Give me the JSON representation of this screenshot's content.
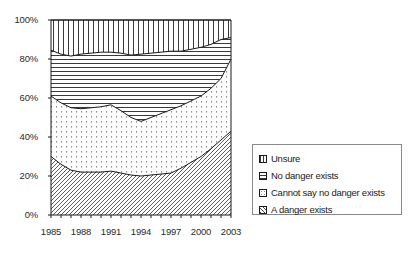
{
  "chart_data": {
    "type": "area",
    "stacked": true,
    "stack_mode": "percent",
    "title": "",
    "xlabel": "",
    "ylabel": "",
    "ylim": [
      0,
      100
    ],
    "ytick_labels": [
      "0%",
      "20%",
      "40%",
      "60%",
      "80%",
      "100%"
    ],
    "ytick_values": [
      0,
      20,
      40,
      60,
      80,
      100
    ],
    "grid": false,
    "legend_position": "right",
    "x": [
      1985,
      1986,
      1987,
      1988,
      1989,
      1990,
      1991,
      1992,
      1993,
      1994,
      1995,
      1996,
      1997,
      1998,
      1999,
      2000,
      2001,
      2002,
      2003
    ],
    "xtick_labels": [
      "1985",
      "1988",
      "1991",
      "1994",
      "1997",
      "2000",
      "2003"
    ],
    "xtick_values": [
      1985,
      1988,
      1991,
      1994,
      1997,
      2000,
      2003
    ],
    "series": [
      {
        "name": "A danger exists",
        "pattern": "diagonal-hatch",
        "order": 1,
        "values": [
          30,
          26,
          23,
          22,
          22,
          22,
          22.5,
          21.5,
          20.5,
          20,
          20.5,
          21,
          21.5,
          24,
          27,
          30,
          34,
          38.5,
          43
        ]
      },
      {
        "name": "Cannot say no danger exists",
        "pattern": "dotted",
        "order": 2,
        "values": [
          31,
          31.5,
          32,
          32.5,
          33,
          33.5,
          34,
          32,
          29.5,
          28,
          29.5,
          31,
          32.5,
          32,
          31.5,
          31,
          31,
          31.5,
          37
        ]
      },
      {
        "name": "No danger exists",
        "pattern": "horizontal-lines",
        "order": 3,
        "values": [
          23.5,
          25,
          26.5,
          28,
          28,
          28,
          27,
          29.5,
          32,
          34.5,
          33,
          31.5,
          30,
          28,
          26.5,
          25,
          22.5,
          20,
          11
        ]
      },
      {
        "name": "Unsure",
        "pattern": "vertical-lines",
        "order": 4,
        "values": [
          15.5,
          17.5,
          18.5,
          17.5,
          17,
          16.5,
          16.5,
          17,
          18,
          17.5,
          17,
          16.5,
          16,
          16,
          15,
          14,
          12.5,
          10,
          9
        ]
      }
    ],
    "cumulative_boundaries": {
      "a_danger_exists": [
        30,
        26,
        23,
        22,
        22,
        22,
        22.5,
        21.5,
        20.5,
        20,
        20.5,
        21,
        21.5,
        24,
        27,
        30,
        34,
        38.5,
        43
      ],
      "plus_cannot_say": [
        61,
        57.5,
        55,
        54.5,
        55,
        55.5,
        56.5,
        53.5,
        50,
        48,
        50,
        52,
        54,
        56,
        58.5,
        61,
        65,
        70,
        80
      ],
      "plus_no_danger": [
        84.5,
        82.5,
        81.5,
        82.5,
        83,
        83.5,
        83.5,
        83,
        82,
        82.5,
        83,
        83.5,
        84,
        84,
        85,
        86,
        87.5,
        90,
        91
      ],
      "total": [
        100,
        100,
        100,
        100,
        100,
        100,
        100,
        100,
        100,
        100,
        100,
        100,
        100,
        100,
        100,
        100,
        100,
        100,
        100
      ]
    }
  },
  "legend": {
    "items": [
      {
        "label": "Unsure",
        "pattern": "vertical-lines"
      },
      {
        "label": "No danger exists",
        "pattern": "horizontal-lines"
      },
      {
        "label": "Cannot say no danger exists",
        "pattern": "dotted"
      },
      {
        "label": "A danger exists",
        "pattern": "diagonal-hatch"
      }
    ]
  },
  "colors": {
    "axis": "#1a1a1a",
    "text": "#2b2b2b",
    "legend_border": "#8a8a8a",
    "fill": "#ffffff",
    "line": "#1a1a1a"
  }
}
